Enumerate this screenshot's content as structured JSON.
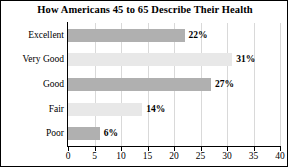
{
  "chart_data": {
    "type": "bar",
    "orientation": "horizontal",
    "title": "How Americans 45 to 65 Describe Their Health",
    "xlabel": "",
    "ylabel": "",
    "categories": [
      "Excellent",
      "Very Good",
      "Good",
      "Fair",
      "Poor"
    ],
    "values": [
      22,
      31,
      27,
      14,
      6
    ],
    "value_labels": [
      "22%",
      "31%",
      "27%",
      "14%",
      "6%"
    ],
    "bar_colors": [
      "#b0b0b0",
      "#e8e8e8",
      "#b0b0b0",
      "#e8e8e8",
      "#b0b0b0"
    ],
    "xlim": [
      0,
      40
    ],
    "xticks": [
      0,
      5,
      10,
      15,
      20,
      25,
      30,
      35,
      40
    ],
    "xtick_labels": [
      "0",
      "5",
      "10",
      "15",
      "20",
      "25",
      "30",
      "35",
      "40"
    ],
    "grid": "vertical",
    "legend": "none",
    "axis_color": "#000000",
    "grid_color": "#d9d9d9",
    "background": "#ffffff"
  }
}
